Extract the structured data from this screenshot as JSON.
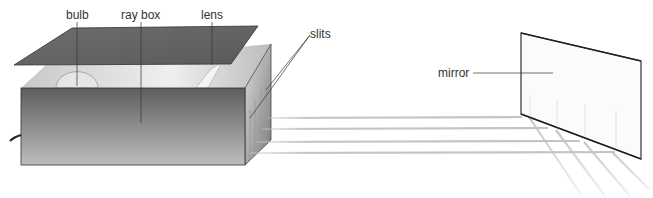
{
  "diagram": {
    "labels": {
      "bulb": "bulb",
      "ray_box": "ray box",
      "lens": "lens",
      "slits": "slits",
      "mirror": "mirror"
    },
    "colors": {
      "box_dark": "#5a5a5a",
      "box_light": "#d8d8d8",
      "lid": "#6a6a6a",
      "ray": "#c4c4c4",
      "line": "#333333"
    },
    "ray_count": 4
  }
}
